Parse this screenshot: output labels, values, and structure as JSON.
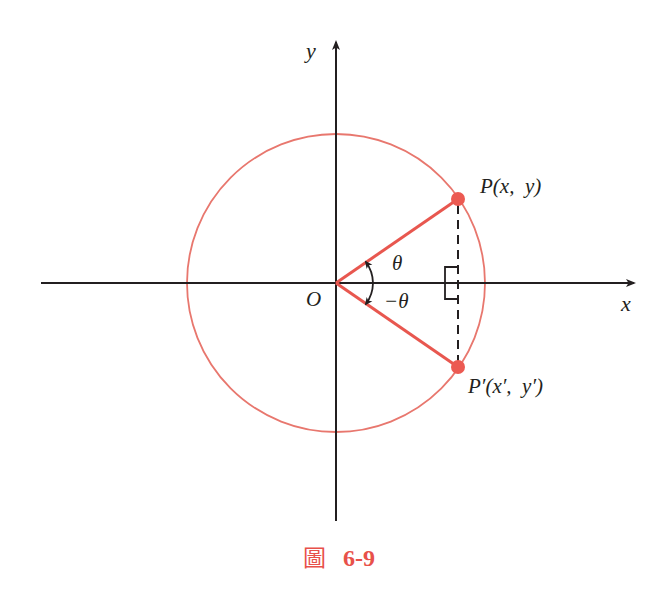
{
  "diagram": {
    "type": "unit-circle-reflection",
    "colors": {
      "circle": "#e8776e",
      "radius": "#e8574f",
      "point": "#ec5a52",
      "axis": "#231f20",
      "caption": "#e8514a"
    },
    "geometry": {
      "origin": [
        336,
        283
      ],
      "radius": 149,
      "P": [
        458,
        199
      ],
      "P_prime": [
        458,
        367
      ]
    },
    "labels": {
      "x_axis": "x",
      "y_axis": "y",
      "origin": "O",
      "P": "P(x,  y)",
      "P_prime": "P′(x′,  y′)",
      "theta": "θ",
      "neg_theta": "−θ"
    },
    "caption": {
      "prefix": "圖",
      "number": "6-9"
    }
  }
}
